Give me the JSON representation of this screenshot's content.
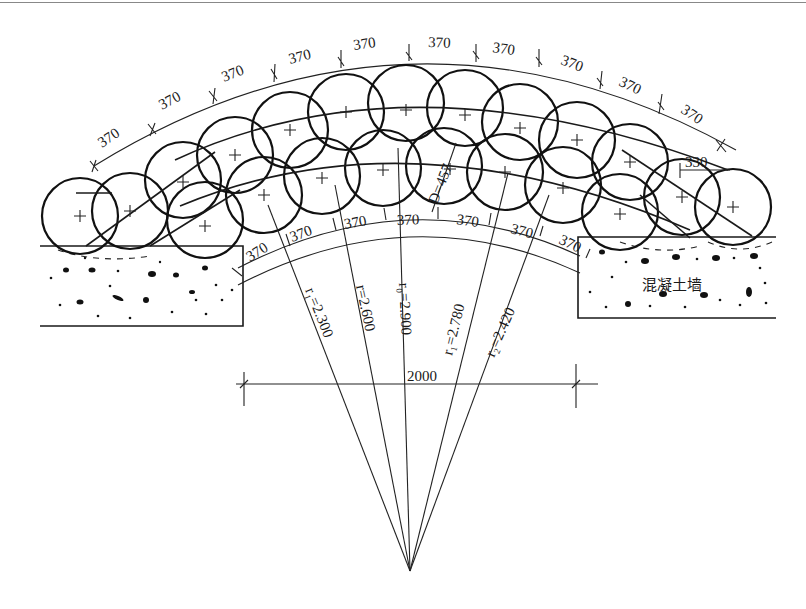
{
  "diagram": {
    "type": "engineering-plan",
    "outer_arc_spacings": [
      "370",
      "370",
      "370",
      "370",
      "370",
      "370",
      "370",
      "370",
      "370",
      "370",
      "370",
      "370"
    ],
    "inner_arc_spacings": [
      "370",
      "370",
      "370",
      "370",
      "370",
      "370",
      "370",
      "370"
    ],
    "pile_diameter_label": "D=457",
    "end_offset_label": "330",
    "span_label": "2000",
    "wall_label": "混凝土墙",
    "radii": [
      {
        "id": "r1_left",
        "label": "r₁=2.300"
      },
      {
        "id": "r",
        "label": "r=2.600"
      },
      {
        "id": "r0",
        "label": "r₀=2.900"
      },
      {
        "id": "r1_right",
        "label": "r₁=2.780"
      },
      {
        "id": "r2",
        "label": "r₂=2.420"
      }
    ],
    "colors": {
      "line": "#1a1a1a",
      "background": "#ffffff"
    }
  }
}
